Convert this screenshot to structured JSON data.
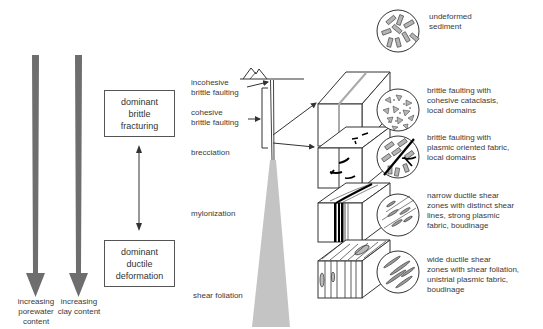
{
  "left_arrows": [
    {
      "label_lines": [
        "increasing",
        "porewater",
        "content"
      ]
    },
    {
      "label_lines": [
        "increasing",
        "clay content"
      ]
    }
  ],
  "regime_boxes": {
    "top": {
      "lines": [
        "dominant",
        "brittle",
        "fracturing"
      ]
    },
    "bottom": {
      "lines": [
        "dominant",
        "ductile",
        "deformation"
      ]
    }
  },
  "depth_labels": [
    {
      "lines": [
        "incohesive",
        "brittle faulting"
      ]
    },
    {
      "lines": [
        "cohesive",
        "brittle faulting"
      ]
    },
    {
      "lines": [
        "brecciation"
      ]
    },
    {
      "lines": [
        "mylonization"
      ]
    },
    {
      "lines": [
        "shear foliation"
      ]
    }
  ],
  "microstructures": [
    {
      "lines": [
        "undeformed",
        "sediment"
      ]
    },
    {
      "lines": [
        "brittle faulting with",
        "cohesive cataclasis,",
        "local domains"
      ]
    },
    {
      "lines": [
        "brittle faulting with",
        "plasmic oriented fabric,",
        "local domains"
      ]
    },
    {
      "lines": [
        "narrow ductile shear",
        "zones with distinct shear",
        "lines, strong plasmic",
        "fabric, boudinage"
      ]
    },
    {
      "lines": [
        "wide ductile shear",
        "zones with shear foliation,",
        "unistrial plasmic fabric,",
        "boudinage"
      ]
    }
  ],
  "colors": {
    "arrow_fill": "#6e6e6e",
    "wedge_fill": "#c4c4c4",
    "line": "#333333",
    "grain_fill": "#b5b5b5"
  }
}
